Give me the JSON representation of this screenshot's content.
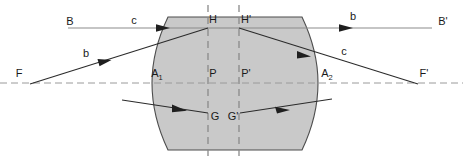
{
  "figure": {
    "type": "optical-ray-diagram",
    "background_color": "#ffffff",
    "lens_fill_color": "#c9c9c9",
    "lens_stroke_color": "#4d4d4d",
    "ray_color": "#2b2b2b",
    "axis_color": "#808080",
    "dashed_color": "#9a9a9a"
  },
  "labels": {
    "object_point": "B",
    "image_point": "B'",
    "focal_point_left": "F",
    "focal_point_right": "F'",
    "principal_plane_left": "H",
    "principal_plane_right": "H'",
    "vertex_left": "A",
    "vertex_left_sub": "1",
    "vertex_right": "A",
    "vertex_right_sub": "2",
    "axis_point_left": "P",
    "axis_point_right": "P'",
    "object_base": "G",
    "image_base": "G'",
    "ray_b_left": "b",
    "ray_b_right": "b",
    "ray_c_left": "c",
    "ray_c_right": "c"
  },
  "geometry": {
    "optical_axis_y": 83,
    "upper_ray_y": 28,
    "principal_plane_left_x": 208,
    "principal_plane_right_x": 239,
    "lens_vertex_left_x": 152,
    "lens_vertex_right_x": 318,
    "lens_top_y": 17,
    "lens_bottom_y": 150,
    "focal_left_x": 30,
    "focal_right_x": 418
  },
  "elements": {
    "lens_body": "biconvex-thick-lens",
    "optical_axis": "horizontal-dashed-axis",
    "principal_planes": "two-vertical-dashed-lines",
    "ray_b": "parallel-incoming-ray-to-focal-point",
    "ray_c": "focal-ray-to-parallel-outgoing",
    "ray_lower": "lower-object-to-image-ray"
  }
}
